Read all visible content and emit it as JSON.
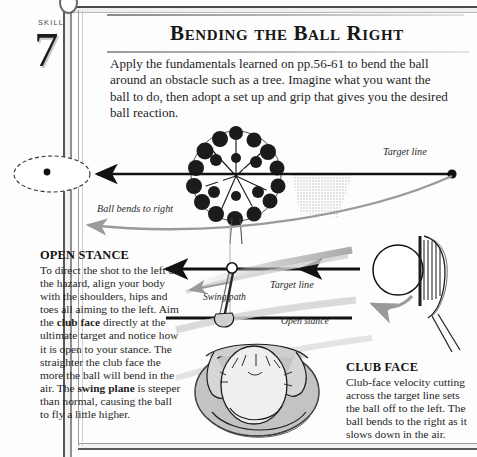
{
  "page": {
    "skill_word": "SKILL",
    "skill_number": "7",
    "title": "Bending the Ball Right",
    "intro": "Apply the fundamentals learned on pp.56-61 to bend the ball around an obstacle such as a tree. Imagine what you want the ball to do, then adopt a set up and grip that gives you the desired ball reaction."
  },
  "columns": {
    "open_stance": {
      "heading": "OPEN STANCE",
      "body_part1": "To direct the shot to the left of the hazard, align your body with the shoulders, hips and toes all aiming to the left. Aim the ",
      "bold1": "club face",
      "body_part2": " directly at the ultimate target and notice how it is open to your stance. The straighter the club face the more the ball will bend in the air. The ",
      "bold2": "swing plane",
      "body_part3": " is steeper than normal, causing the ball to fly a little higher."
    },
    "club_face": {
      "heading": "CLUB FACE",
      "body": "Club-face velocity cutting across the target line sets the ball off to the left. The ball bends to the right as it slows down in the air."
    }
  },
  "diagram_labels": {
    "target_line_top": "Target line",
    "ball_bends": "Ball bends to right",
    "target_line_mid": "Target line",
    "swing_path": "Swing path",
    "open_stance": "Open stance"
  },
  "colors": {
    "ink": "#1a1a1a",
    "paper": "#fdfdfd",
    "grey_arrow": "#9a9a9a",
    "stipple": "#c9c9c9",
    "golfer_fill": "#c3c3c3"
  }
}
